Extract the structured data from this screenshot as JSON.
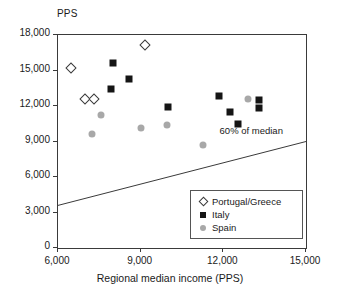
{
  "chart_data": {
    "type": "scatter",
    "title": "",
    "xlabel": "Regional median income (PPS)",
    "ylabel": "PPS",
    "ylabel_position": "above-axis",
    "xlim": [
      6000,
      15000
    ],
    "ylim": [
      0,
      18000
    ],
    "xticks": [
      6000,
      9000,
      12000,
      15000
    ],
    "xtick_labels": [
      "6,000",
      "9,000",
      "12,000",
      "15,000"
    ],
    "yticks": [
      0,
      3000,
      6000,
      9000,
      12000,
      15000,
      18000
    ],
    "ytick_labels": [
      "0",
      "3,000",
      "6,000",
      "9,000",
      "12,000",
      "15,000",
      "18,000"
    ],
    "grid": false,
    "legend_position": "lower-right-inside",
    "series": [
      {
        "name": "Portugal/Greece",
        "marker": "open-diamond",
        "color": "#ffffff",
        "edge_color": "#3a3a3a",
        "points": [
          {
            "x": 6470,
            "y": 15250
          },
          {
            "x": 6980,
            "y": 12600
          },
          {
            "x": 7300,
            "y": 12600
          },
          {
            "x": 9160,
            "y": 17150
          }
        ]
      },
      {
        "name": "Italy",
        "marker": "filled-square",
        "color": "#151515",
        "points": [
          {
            "x": 7930,
            "y": 13400
          },
          {
            "x": 7990,
            "y": 15600
          },
          {
            "x": 8570,
            "y": 14250
          },
          {
            "x": 10000,
            "y": 11900
          },
          {
            "x": 11850,
            "y": 12850
          },
          {
            "x": 12250,
            "y": 11500
          },
          {
            "x": 12550,
            "y": 10450
          },
          {
            "x": 13300,
            "y": 12500
          },
          {
            "x": 13300,
            "y": 11850
          }
        ]
      },
      {
        "name": "Spain",
        "marker": "filled-circle",
        "color": "#a8a8a8",
        "points": [
          {
            "x": 7250,
            "y": 9600
          },
          {
            "x": 7560,
            "y": 11250
          },
          {
            "x": 9000,
            "y": 10150
          },
          {
            "x": 9950,
            "y": 10400
          },
          {
            "x": 11270,
            "y": 8700
          },
          {
            "x": 12900,
            "y": 12600
          }
        ]
      }
    ],
    "reference_line": {
      "label": "60% of median",
      "x_start": 6000,
      "y_start": 3600,
      "x_end": 15000,
      "y_end": 9000,
      "color": "#3a3a3a"
    }
  },
  "axis": {
    "y_unit_label": "PPS",
    "x_title": "Regional median income (PPS)"
  },
  "legend": {
    "entries": [
      {
        "label": "Portugal/Greece",
        "marker": "open-diamond"
      },
      {
        "label": "Italy",
        "marker": "filled-square"
      },
      {
        "label": "Spain",
        "marker": "filled-circle"
      }
    ]
  },
  "annotation": {
    "reference_line_label": "60% of median"
  }
}
